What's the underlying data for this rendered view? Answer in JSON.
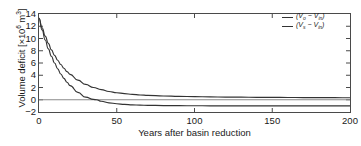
{
  "chart_data": {
    "type": "line",
    "title": "",
    "xlabel": "Years after basin reduction",
    "ylabel_text": "Volume deficit [",
    "ylabel_factor": "×10",
    "ylabel_exp": "6",
    "ylabel_units": " m",
    "ylabel_units_exp": "3",
    "ylabel_close": "]",
    "ylabel_full": "Volume deficit [×10⁶ m³]",
    "xlim": [
      0,
      200
    ],
    "ylim": [
      -2,
      14
    ],
    "xticks": [
      0,
      50,
      100,
      150,
      200
    ],
    "yticks": [
      14,
      12,
      10,
      8,
      6,
      4,
      2,
      0,
      -2
    ],
    "grid": false,
    "zero_line": true,
    "legend_position": "top-right",
    "line_color": "#333333",
    "frame_color": "#4a4a4a",
    "series": [
      {
        "name": "(Vo - Vin)",
        "legend_prefix": "(V",
        "legend_sub1": "o",
        "legend_minus": " − V",
        "legend_sub2": "in",
        "legend_suffix": ")",
        "x": [
          0,
          2,
          4,
          6,
          8,
          10,
          12,
          14,
          16,
          18,
          20,
          25,
          30,
          35,
          40,
          45,
          50,
          55,
          60,
          65,
          70,
          80,
          90,
          100,
          110,
          120,
          130,
          140,
          150,
          160,
          170,
          180,
          190,
          200
        ],
        "values": [
          13.3,
          11.75,
          10.4,
          9.2,
          8.15,
          7.25,
          6.45,
          5.75,
          5.15,
          4.6,
          4.15,
          3.2,
          2.5,
          2.0,
          1.65,
          1.35,
          1.15,
          1.0,
          0.88,
          0.78,
          0.72,
          0.62,
          0.55,
          0.5,
          0.47,
          0.44,
          0.42,
          0.4,
          0.39,
          0.37,
          0.36,
          0.35,
          0.34,
          0.33
        ]
      },
      {
        "name": "(Vs - Vin)",
        "legend_prefix": "(V",
        "legend_sub1": "s",
        "legend_minus": " − V",
        "legend_sub2": "in",
        "legend_suffix": ")",
        "x": [
          0,
          2,
          4,
          6,
          8,
          10,
          12,
          14,
          16,
          18,
          20,
          25,
          30,
          35,
          37,
          40,
          45,
          50,
          55,
          60,
          65,
          70,
          80,
          90,
          100,
          110,
          120,
          130,
          140,
          150,
          160,
          170,
          180,
          190,
          200
        ],
        "values": [
          13.3,
          11.4,
          9.75,
          8.3,
          7.1,
          6.0,
          5.05,
          4.2,
          3.5,
          2.85,
          2.3,
          1.2,
          0.42,
          0.05,
          0.0,
          -0.25,
          -0.5,
          -0.65,
          -0.76,
          -0.83,
          -0.88,
          -0.91,
          -0.95,
          -0.97,
          -0.98,
          -0.99,
          -0.99,
          -1.0,
          -1.0,
          -1.0,
          -1.0,
          -1.0,
          -1.0,
          -1.0,
          -1.0
        ]
      }
    ]
  }
}
